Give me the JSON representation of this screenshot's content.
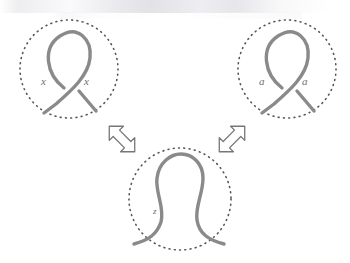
{
  "figure": {
    "name": "reidemeister-move-one-diagram",
    "background_color": "#ffffff",
    "strand_color": "#8a8a8a",
    "circle_color": "#555555",
    "label_color": "#6f6f6f",
    "arrow_color": "#777777"
  },
  "panels": [
    {
      "id": "left-tangle",
      "name": "left-crossing-tangle",
      "center": {
        "x": 69,
        "y": 69
      },
      "radius": 49,
      "crossing": "positive-curl",
      "labels": [
        {
          "id": "left-label-1",
          "text": "x",
          "x": 44,
          "y": 82
        },
        {
          "id": "left-label-2",
          "text": "x",
          "x": 87,
          "y": 82
        }
      ]
    },
    {
      "id": "right-tangle",
      "name": "right-crossing-tangle",
      "center": {
        "x": 287,
        "y": 69
      },
      "radius": 49,
      "crossing": "positive-curl",
      "labels": [
        {
          "id": "right-label-1",
          "text": "a",
          "x": 262,
          "y": 82
        },
        {
          "id": "right-label-2",
          "text": "a",
          "x": 305,
          "y": 82
        }
      ]
    },
    {
      "id": "bottom-tangle",
      "name": "bottom-untwisted-tangle",
      "center": {
        "x": 180,
        "y": 199
      },
      "radius": 51,
      "crossing": "none",
      "labels": [
        {
          "id": "bottom-label-1",
          "text": "z",
          "x": 155,
          "y": 212
        }
      ]
    }
  ],
  "arrows": [
    {
      "id": "arrow-left",
      "name": "double-arrow-left",
      "direction": "northwest-southeast",
      "x": 101,
      "y": 118,
      "width": 40,
      "height": 40
    },
    {
      "id": "arrow-right",
      "name": "double-arrow-right",
      "direction": "northeast-southwest",
      "x": 211,
      "y": 118,
      "width": 42,
      "height": 40
    }
  ]
}
